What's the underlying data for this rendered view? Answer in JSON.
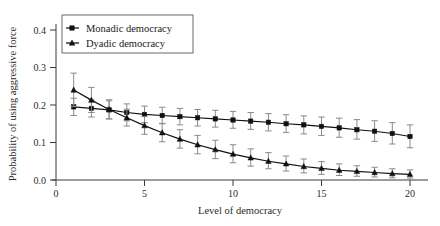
{
  "chart_data": {
    "type": "line",
    "title": "",
    "xlabel": "Level of democracy",
    "ylabel": "Probability of using aggressive force",
    "xlim": [
      0,
      20.6
    ],
    "ylim": [
      0.0,
      0.43
    ],
    "xticks": [
      0,
      5,
      10,
      15,
      20
    ],
    "xtick_labels": [
      "0",
      "5",
      "10",
      "15",
      "20"
    ],
    "yticks": [
      0.0,
      0.1,
      0.2,
      0.3,
      0.4
    ],
    "ytick_labels": [
      "0.0",
      "0.1",
      "0.2",
      "0.3",
      "0.4"
    ],
    "grid": false,
    "legend_position": "upper left",
    "x": [
      1,
      2,
      3,
      4,
      5,
      6,
      7,
      8,
      9,
      10,
      11,
      12,
      13,
      14,
      15,
      16,
      17,
      18,
      19,
      20
    ],
    "series": [
      {
        "name": "Monadic democracy",
        "marker": "square",
        "values": [
          0.195,
          0.191,
          0.187,
          0.18,
          0.175,
          0.172,
          0.169,
          0.166,
          0.163,
          0.16,
          0.157,
          0.154,
          0.15,
          0.147,
          0.143,
          0.139,
          0.134,
          0.13,
          0.124,
          0.116
        ],
        "err_low": [
          0.172,
          0.168,
          0.163,
          0.158,
          0.153,
          0.15,
          0.147,
          0.144,
          0.141,
          0.138,
          0.135,
          0.131,
          0.127,
          0.123,
          0.119,
          0.114,
          0.109,
          0.103,
          0.096,
          0.086
        ],
        "err_high": [
          0.218,
          0.214,
          0.211,
          0.203,
          0.197,
          0.194,
          0.191,
          0.188,
          0.186,
          0.183,
          0.18,
          0.177,
          0.174,
          0.171,
          0.168,
          0.165,
          0.161,
          0.158,
          0.153,
          0.147
        ]
      },
      {
        "name": "Dyadic democracy",
        "marker": "triangle",
        "values": [
          0.24,
          0.213,
          0.188,
          0.166,
          0.145,
          0.126,
          0.109,
          0.094,
          0.081,
          0.069,
          0.059,
          0.05,
          0.043,
          0.036,
          0.031,
          0.026,
          0.023,
          0.02,
          0.017,
          0.015
        ],
        "err_low": [
          0.196,
          0.18,
          0.163,
          0.144,
          0.122,
          0.102,
          0.085,
          0.07,
          0.057,
          0.046,
          0.037,
          0.03,
          0.024,
          0.019,
          0.015,
          0.012,
          0.01,
          0.008,
          0.006,
          0.005
        ],
        "err_high": [
          0.285,
          0.247,
          0.214,
          0.189,
          0.169,
          0.151,
          0.134,
          0.119,
          0.106,
          0.094,
          0.083,
          0.073,
          0.064,
          0.056,
          0.049,
          0.043,
          0.038,
          0.034,
          0.03,
          0.027
        ]
      }
    ],
    "legend": [
      {
        "label": "Monadic democracy",
        "marker": "square"
      },
      {
        "label": "Dyadic democracy",
        "marker": "triangle"
      }
    ]
  }
}
